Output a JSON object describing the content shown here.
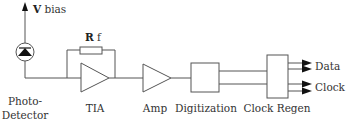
{
  "diagram": {
    "type": "optical-receiver-block-diagram",
    "labels": {
      "vbias_v": "V",
      "vbias_rest": " bias",
      "rf_r": "R",
      "rf_rest": " f",
      "photodetector_line1": "Photo-",
      "photodetector_line2": "Detector",
      "tia": "TIA",
      "amp": "Amp",
      "digitization": "Digitization",
      "clock_regen": "Clock Regen",
      "data": "Data",
      "clock": "Clock"
    },
    "blocks": [
      "Photo-Detector",
      "TIA",
      "Amp",
      "Digitization",
      "Clock Regen"
    ],
    "outputs": [
      "Data",
      "Clock"
    ],
    "colors": {
      "line": "#555555",
      "text": "#333333",
      "fill": "#000000"
    }
  }
}
